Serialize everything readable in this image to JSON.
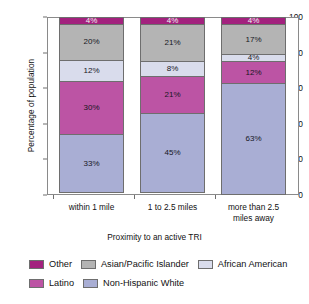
{
  "chart_data": {
    "type": "bar",
    "subtype": "stacked-100-percent",
    "title": "",
    "xlabel": "Proximity to an active TRI",
    "ylabel": "Percentage of population",
    "categories": [
      "within 1 mile",
      "1 to 2.5 miles",
      "more than 2.5 miles away"
    ],
    "ylim": [
      0,
      100
    ],
    "yticks": [
      0,
      20,
      40,
      60,
      80,
      100
    ],
    "ytick_labels": [
      "0",
      "20",
      "40",
      "60",
      "80",
      "100"
    ],
    "grid": false,
    "legend_position": "bottom",
    "series": [
      {
        "name": "Non-Hispanic White",
        "color": "#a9aed4",
        "values": [
          33,
          45,
          63
        ],
        "labels": [
          "33%",
          "45%",
          "63%"
        ]
      },
      {
        "name": "Latino",
        "color": "#bc54a4",
        "values": [
          30,
          21,
          12
        ],
        "labels": [
          "30%",
          "21%",
          "12%"
        ]
      },
      {
        "name": "African American",
        "color": "#d9dcec",
        "values": [
          12,
          8,
          4
        ],
        "labels": [
          "12%",
          "8%",
          "4%"
        ]
      },
      {
        "name": "Asian/Pacific Islander",
        "color": "#b4b4b4",
        "values": [
          20,
          21,
          17
        ],
        "labels": [
          "20%",
          "21%",
          "17%"
        ]
      },
      {
        "name": "Other",
        "color": "#a3217e",
        "values": [
          4,
          4,
          4
        ],
        "labels": [
          "4%",
          "4%",
          "4%"
        ]
      }
    ]
  },
  "axes": {
    "y_title": "Percentage of population",
    "x_title": "Proximity to an active TRI",
    "y_ticks": [
      "100",
      "80",
      "60",
      "40",
      "20",
      "0"
    ],
    "x_categories": [
      "within 1 mile",
      "1 to 2.5 miles",
      "more than 2.5 miles away"
    ]
  },
  "bars": [
    {
      "category": "within 1 mile",
      "segments": [
        {
          "name": "Other",
          "label": "4%",
          "value": 4,
          "color": "#a3217e"
        },
        {
          "name": "Asian/Pacific Islander",
          "label": "20%",
          "value": 20,
          "color": "#b4b4b4"
        },
        {
          "name": "African American",
          "label": "12%",
          "value": 12,
          "color": "#d9dcec"
        },
        {
          "name": "Latino",
          "label": "30%",
          "value": 30,
          "color": "#bc54a4"
        },
        {
          "name": "Non-Hispanic White",
          "label": "33%",
          "value": 33,
          "color": "#a9aed4"
        }
      ]
    },
    {
      "category": "1 to 2.5 miles",
      "segments": [
        {
          "name": "Other",
          "label": "4%",
          "value": 4,
          "color": "#a3217e"
        },
        {
          "name": "Asian/Pacific Islander",
          "label": "21%",
          "value": 21,
          "color": "#b4b4b4"
        },
        {
          "name": "African American",
          "label": "8%",
          "value": 8,
          "color": "#d9dcec"
        },
        {
          "name": "Latino",
          "label": "21%",
          "value": 21,
          "color": "#bc54a4"
        },
        {
          "name": "Non-Hispanic White",
          "label": "45%",
          "value": 45,
          "color": "#a9aed4"
        }
      ]
    },
    {
      "category": "more than 2.5 miles away",
      "segments": [
        {
          "name": "Other",
          "label": "4%",
          "value": 4,
          "color": "#a3217e"
        },
        {
          "name": "Asian/Pacific Islander",
          "label": "17%",
          "value": 17,
          "color": "#b4b4b4"
        },
        {
          "name": "African American",
          "label": "4%",
          "value": 4,
          "color": "#d9dcec"
        },
        {
          "name": "Latino",
          "label": "12%",
          "value": 12,
          "color": "#bc54a4"
        },
        {
          "name": "Non-Hispanic White",
          "label": "63%",
          "value": 63,
          "color": "#a9aed4"
        }
      ]
    }
  ],
  "category_label_lines": [
    [
      "within 1 mile"
    ],
    [
      "1 to 2.5 miles"
    ],
    [
      "more than 2.5",
      "miles away"
    ]
  ],
  "legend": {
    "rows": [
      [
        {
          "label": "Other",
          "color": "#a3217e"
        },
        {
          "label": "Asian/Pacific Islander",
          "color": "#b4b4b4"
        },
        {
          "label": "African American",
          "color": "#d9dcec"
        }
      ],
      [
        {
          "label": "Latino",
          "color": "#bc54a4"
        },
        {
          "label": "Non-Hispanic White",
          "color": "#a9aed4"
        }
      ]
    ]
  }
}
